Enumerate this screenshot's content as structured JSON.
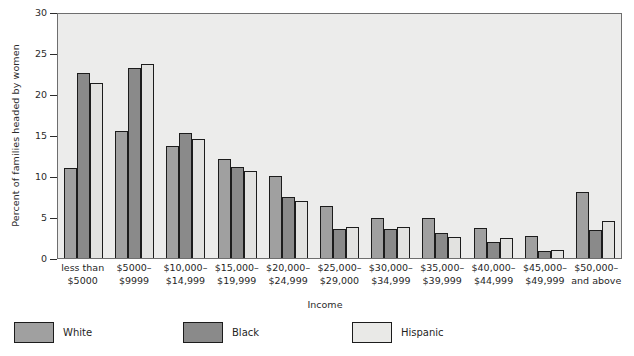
{
  "chart_data": {
    "type": "bar",
    "title": "",
    "subtitle": "",
    "xlabel": "Income",
    "ylabel": "Percent of families headed by women",
    "ylim": [
      0,
      30
    ],
    "yticks": [
      0,
      5,
      10,
      15,
      20,
      25,
      30
    ],
    "grid": false,
    "legend_position": "bottom",
    "categories": [
      "less than $5000",
      "$5000–$9999",
      "$10,000–$14,999",
      "$15,000–$19,999",
      "$20,000–$24,999",
      "$25,000–$29,000",
      "$30,000–$34,999",
      "$35,000–$39,999",
      "$40,000–$44,999",
      "$45,000–$49,999",
      "$50,000–and above"
    ],
    "category_lines": [
      [
        "less than",
        "$5000"
      ],
      [
        "$5000–",
        "$9999"
      ],
      [
        "$10,000–",
        "$14,999"
      ],
      [
        "$15,000–",
        "$19,999"
      ],
      [
        "$20,000–",
        "$24,999"
      ],
      [
        "$25,000–",
        "$29,000"
      ],
      [
        "$30,000–",
        "$34,999"
      ],
      [
        "$35,000–",
        "$39,999"
      ],
      [
        "$40,000–",
        "$44,999"
      ],
      [
        "$45,000–",
        "$49,999"
      ],
      [
        "$50,000–",
        "and above"
      ]
    ],
    "series": [
      {
        "name": "White",
        "color": "#a0a0a0",
        "values": [
          11.0,
          15.5,
          13.6,
          12.1,
          10.0,
          6.4,
          4.9,
          4.9,
          3.6,
          2.7,
          8.1
        ]
      },
      {
        "name": "Black",
        "color": "#8a8a8a",
        "values": [
          22.6,
          23.2,
          15.3,
          11.1,
          7.4,
          3.5,
          3.5,
          3.0,
          2.0,
          0.9,
          3.4
        ]
      },
      {
        "name": "Hispanic",
        "color": "#e2e2e0",
        "values": [
          21.3,
          23.7,
          14.5,
          10.6,
          7.0,
          3.8,
          3.8,
          2.6,
          2.4,
          1.0,
          4.5
        ]
      }
    ]
  },
  "legend": {
    "items": [
      {
        "label": "White"
      },
      {
        "label": "Black"
      },
      {
        "label": "Hispanic"
      }
    ]
  },
  "colors": {
    "plot_background": "#ececeb",
    "axis_line": "#6e6e6e",
    "bar_outline": "#1c1c1c",
    "text": "#1f1f1f"
  }
}
